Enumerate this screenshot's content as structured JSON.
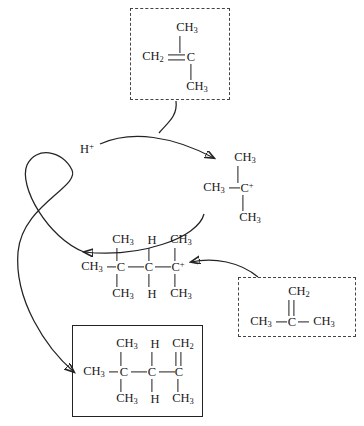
{
  "diagram": {
    "ink_color": "#232323",
    "proton": {
      "label": "H",
      "charge": "+",
      "name": "proton-reactant"
    },
    "reactant_box_top": {
      "style": "dashed",
      "name": "isobutylene-monomer-top",
      "atoms": {
        "ch2": "CH",
        "ch2_sub": "2",
        "center": "C",
        "methyl_up": "CH",
        "methyl_up_sub": "3",
        "methyl_down": "CH",
        "methyl_down_sub": "3"
      },
      "bond_type": "double"
    },
    "carbocation": {
      "name": "tert-butyl-carbocation",
      "atoms": {
        "methyl_left": "CH",
        "methyl_left_sub": "3",
        "center": "C",
        "center_charge": "+",
        "methyl_up": "CH",
        "methyl_up_sub": "3",
        "methyl_down": "CH",
        "methyl_down_sub": "3"
      }
    },
    "dimer_cation": {
      "name": "dimer-carbocation",
      "terminal_left": "CH",
      "terminal_left_sub": "3",
      "backbone": [
        "C",
        "C",
        "C"
      ],
      "charge_on": 2,
      "charge": "+",
      "top_substituents": [
        {
          "label": "CH",
          "sub": "3"
        },
        {
          "label": "H",
          "sub": ""
        },
        {
          "label": "CH",
          "sub": "3"
        }
      ],
      "bottom_substituents": [
        {
          "label": "CH",
          "sub": "3"
        },
        {
          "label": "H",
          "sub": ""
        },
        {
          "label": "CH",
          "sub": "3"
        }
      ]
    },
    "reactant_box_bottom": {
      "style": "dashed",
      "name": "isobutylene-monomer-bottom",
      "atoms": {
        "ch2_top": "CH",
        "ch2_top_sub": "2",
        "center": "C",
        "methyl_left": "CH",
        "methyl_left_sub": "3",
        "methyl_right": "CH",
        "methyl_right_sub": "3"
      },
      "bond_type": "double"
    },
    "product_box": {
      "style": "solid",
      "name": "alkene-dimer-product",
      "terminal_left": "CH",
      "terminal_left_sub": "3",
      "backbone": [
        "C",
        "C",
        "C"
      ],
      "top_substituents": [
        {
          "label": "CH",
          "sub": "3"
        },
        {
          "label": "H",
          "sub": ""
        },
        {
          "label": "CH",
          "sub": "2"
        }
      ],
      "bottom_substituents": [
        {
          "label": "CH",
          "sub": "3"
        },
        {
          "label": "H",
          "sub": ""
        },
        {
          "label": "CH",
          "sub": "3"
        }
      ],
      "double_bond_position": "right-carbon-to-top-CH2"
    },
    "arrows": [
      {
        "name": "arrow-monomer-to-carbocation",
        "from": "isobutylene-monomer-top",
        "to": "tert-butyl-carbocation"
      },
      {
        "name": "arrow-proton-to-carbocation",
        "from": "proton-reactant",
        "to": "tert-butyl-carbocation"
      },
      {
        "name": "arrow-carbocation-to-dimer",
        "from": "tert-butyl-carbocation",
        "to": "dimer-carbocation"
      },
      {
        "name": "arrow-monomer-bottom-to-dimer",
        "from": "isobutylene-monomer-bottom",
        "to": "dimer-carbocation"
      },
      {
        "name": "arrow-dimer-to-product",
        "from": "dimer-carbocation",
        "to": "alkene-dimer-product"
      },
      {
        "name": "arrow-proton-release-loop",
        "from": "dimer-carbocation",
        "to": "proton-reactant"
      }
    ]
  }
}
